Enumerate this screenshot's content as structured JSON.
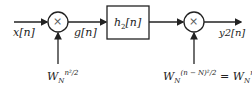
{
  "diagram": {
    "input_label": "x[n]",
    "mid_label": "g[n]",
    "output_label": "y2[n]",
    "block": {
      "label_main": "h",
      "label_sub": "2",
      "label_arg": "[n]"
    },
    "multiplier1": {
      "symbol": "×",
      "factor_base": "W",
      "factor_sub": "N",
      "factor_sup": "n²/2"
    },
    "multiplier2": {
      "symbol": "×",
      "factor_base": "W",
      "factor_sub": "N",
      "factor_sup": "(n − N)²/2",
      "equals": "=",
      "factor2_base": "W",
      "factor2_sub": "N",
      "factor2_sup": "n²/2"
    }
  }
}
